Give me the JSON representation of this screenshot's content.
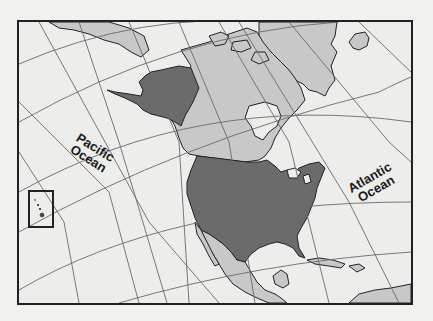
{
  "map": {
    "title": "North America — United States highlighted",
    "projection": "conic graticule",
    "labels": {
      "pacific": {
        "line1": "Pacific",
        "line2": "Ocean"
      },
      "atlantic": {
        "line1": "Atlantic",
        "line2": "Ocean"
      }
    },
    "highlighted_regions": [
      "Alaska",
      "Contiguous United States",
      "Hawaii (inset)"
    ],
    "other_land_regions": [
      "Canada",
      "Greenland",
      "Iceland",
      "Russia (Chukotka)",
      "Mexico",
      "Central America",
      "Caribbean islands"
    ],
    "inset": {
      "region": "Hawaii",
      "frame": "black rectangle"
    },
    "colors": {
      "highlight": "#6b6b6b",
      "land": "#c8c8c8",
      "ocean": "#ededeb",
      "outline": "#222222",
      "graticule": "#6a6a6a",
      "page_background": "#f1f1ef"
    }
  }
}
